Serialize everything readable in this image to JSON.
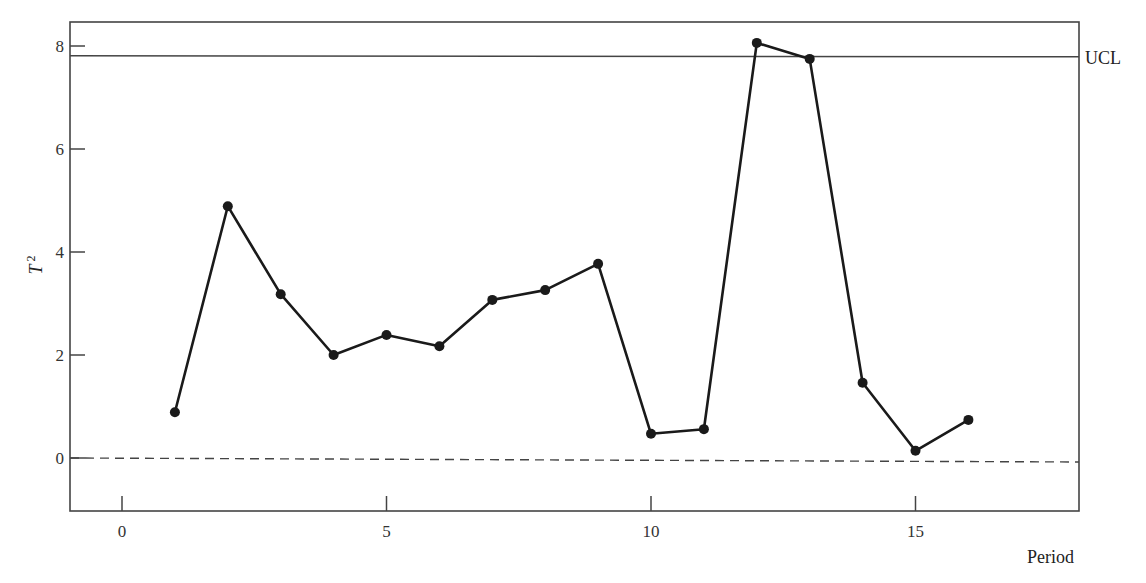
{
  "chart_data": {
    "type": "line",
    "title": "",
    "xlabel": "Period",
    "ylabel": "T 2",
    "ylabel_main": "T",
    "ylabel_sup": "2",
    "xlim": [
      -1,
      18
    ],
    "ylim": [
      -1,
      8.5
    ],
    "x_ticks": [
      0,
      5,
      10,
      15
    ],
    "x_tick_labels": [
      "0",
      "5",
      "10",
      "15"
    ],
    "y_ticks": [
      0,
      2,
      4,
      6,
      8
    ],
    "y_tick_labels": [
      "0",
      "2",
      "4",
      "6",
      "8"
    ],
    "grid": false,
    "legend": null,
    "series": [
      {
        "name": "T2",
        "x": [
          1,
          2,
          3,
          4,
          5,
          6,
          7,
          8,
          9,
          10,
          11,
          12,
          13,
          14,
          15,
          16
        ],
        "values": [
          0.89,
          4.89,
          3.18,
          2.0,
          2.39,
          2.17,
          3.07,
          3.26,
          3.77,
          0.47,
          0.56,
          8.06,
          7.75,
          1.46,
          0.14,
          0.74
        ]
      }
    ],
    "reference_lines": [
      {
        "name": "UCL",
        "label": "UCL",
        "y": 7.81,
        "style": "solid"
      },
      {
        "name": "zero",
        "label": "",
        "y": 0,
        "style": "dashed"
      }
    ]
  }
}
